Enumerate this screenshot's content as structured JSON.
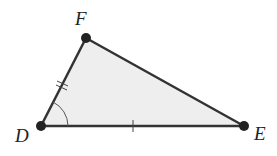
{
  "diagram": {
    "type": "triangle",
    "fill_color": "#eeeeee",
    "stroke_color": "#333333",
    "vertices": [
      {
        "label": "D",
        "x": 41,
        "y": 126
      },
      {
        "label": "F",
        "x": 86,
        "y": 38
      },
      {
        "label": "E",
        "x": 244,
        "y": 126
      }
    ],
    "labels": {
      "D": "D",
      "E": "E",
      "F": "F"
    },
    "marks": [
      {
        "side": "DF",
        "ticks": 2
      },
      {
        "side": "DE",
        "ticks": 1
      },
      {
        "angle": "D",
        "arc": true
      }
    ]
  }
}
